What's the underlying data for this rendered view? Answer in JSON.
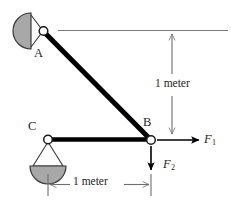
{
  "figure": {
    "background_color": "#ffffff",
    "member_color": "#000000",
    "support_fill_color": "#a8a8a8",
    "support_stroke_color": "#3a3a3a",
    "dimension_line_color": "#6e6e6e",
    "force_arrow_color": "#000000",
    "joint_fill_color": "#ffffff"
  },
  "labels": {
    "node_a": "A",
    "node_b": "B",
    "node_c": "C",
    "force_1": "F",
    "force_1_sub": "1",
    "force_2": "F",
    "force_2_sub": "2",
    "vertical_dimension": "1 meter",
    "horizontal_dimension": "1 meter"
  },
  "geometry": {
    "point_a": {
      "x": 43,
      "y": 31
    },
    "point_b": {
      "x": 151,
      "y": 140
    },
    "point_c": {
      "x": 48,
      "y": 140
    },
    "reference_line_y": 31,
    "vertical_dimension_top_y": 31,
    "vertical_dimension_bottom_y": 140,
    "horizontal_dimension_y": 185,
    "horizontal_dimension_left_x": 48,
    "horizontal_dimension_right_x": 151
  }
}
